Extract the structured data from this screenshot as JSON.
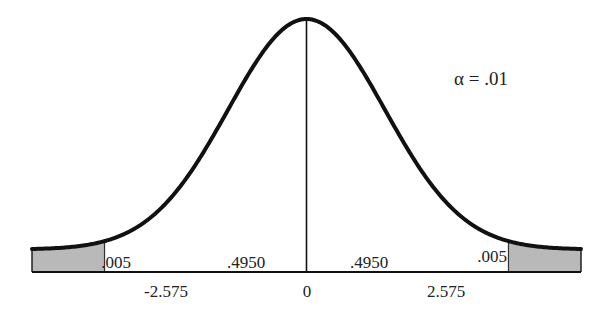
{
  "chart_data": {
    "type": "area",
    "title": "",
    "alpha_label": "α = .01",
    "xlabel": "",
    "ylabel": "",
    "x_range": [
      -3.5,
      3.5
    ],
    "critical_values": [
      -2.575,
      2.575
    ],
    "tick_labels": [
      "-2.575",
      "0",
      "2.575"
    ],
    "ticks": [
      -2.575,
      0,
      2.575
    ],
    "regions": [
      {
        "name": "left-tail",
        "from": -3.5,
        "to": -2.575,
        "area_label": ".005",
        "shaded": true
      },
      {
        "name": "left-center",
        "from": -2.575,
        "to": 0,
        "area_label": ".4950",
        "shaded": false
      },
      {
        "name": "right-center",
        "from": 0,
        "to": 2.575,
        "area_label": ".4950",
        "shaded": false
      },
      {
        "name": "right-tail",
        "from": 2.575,
        "to": 3.5,
        "area_label": ".005",
        "shaded": true
      }
    ],
    "grid": false,
    "legend": "none"
  },
  "colors": {
    "curve": "#111111",
    "shade": "#b9b9b9",
    "lines": "#222222",
    "background": "#ffffff"
  }
}
